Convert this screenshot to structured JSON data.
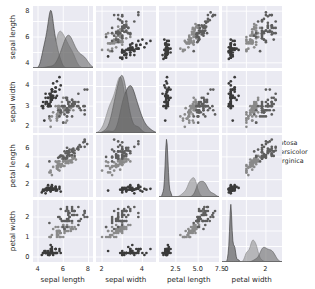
{
  "figure": {
    "type": "pairplot-scatter-matrix",
    "background": "#ffffff",
    "panel_background": "#eaeaf2",
    "gridline_color": "#ffffff",
    "width": 315,
    "height": 289
  },
  "legend": {
    "position": "center-right",
    "entries": [
      {
        "label": "setosa",
        "color": "#3b3b3b"
      },
      {
        "label": "versicolor",
        "color": "#8a8a8a"
      },
      {
        "label": "virginica",
        "color": "#5e5e5e"
      }
    ]
  },
  "chart_data": {
    "type": "scatter",
    "title": "",
    "variables": [
      "sepal length",
      "sepal width",
      "petal length",
      "petal width"
    ],
    "groups": [
      "setosa",
      "versicolor",
      "virginica"
    ],
    "group_colors": [
      "#3b3b3b",
      "#8a8a8a",
      "#5e5e5e"
    ],
    "legend_position": "center-right",
    "grid": true,
    "diagonal": "kde",
    "axes": {
      "sepal length": {
        "label": "sepal length",
        "lim": [
          3.6,
          8.4
        ],
        "ticks": [
          4,
          6,
          8
        ],
        "ticklabels": [
          "4",
          "6",
          "8"
        ]
      },
      "sepal width": {
        "label": "sepal width",
        "lim": [
          1.7,
          4.7
        ],
        "ticks": [
          2,
          3,
          4
        ],
        "ticklabels": [
          "2",
          "3",
          "4"
        ]
      },
      "petal length": {
        "label": "petal length",
        "lim": [
          0.6,
          7.4
        ],
        "ticks": [
          2.5,
          5.0,
          7.5
        ],
        "ticklabels": [
          "2.5",
          "5.0",
          "7.5"
        ]
      },
      "petal width": {
        "label": "petal width",
        "lim": [
          -0.25,
          2.85
        ],
        "ticks": [
          0,
          1,
          2
        ],
        "ticklabels": [
          "0",
          "1",
          "2"
        ]
      }
    },
    "x_tick_rows": {
      "sepal length": [
        "4",
        "6",
        "8"
      ],
      "sepal width": [
        "2",
        "4"
      ],
      "petal length": [
        "2.5",
        "5.0",
        "7.5"
      ],
      "petal width": [
        "0",
        "2"
      ]
    },
    "y_tick_cols": {
      "sepal length": [
        "4",
        "6",
        "8"
      ],
      "sepal width": [
        "2",
        "3",
        "4"
      ],
      "petal length": [
        "2",
        "4",
        "6"
      ],
      "petal width": [
        "0",
        "1",
        "2"
      ]
    },
    "data": {
      "setosa": {
        "sepal length": [
          5.1,
          4.9,
          4.7,
          4.6,
          5.0,
          5.4,
          4.6,
          5.0,
          4.4,
          4.9,
          5.4,
          4.8,
          4.8,
          4.3,
          5.8,
          5.7,
          5.4,
          5.1,
          5.7,
          5.1,
          5.4,
          5.1,
          4.6,
          5.1,
          4.8,
          5.0,
          5.0,
          5.2,
          5.2,
          4.7,
          4.8,
          5.4,
          5.2,
          5.5,
          4.9,
          5.0,
          5.5,
          4.9,
          4.4,
          5.1,
          5.0,
          4.5,
          4.4,
          5.0,
          5.1,
          4.8,
          5.1,
          4.6,
          5.3,
          5.0
        ],
        "sepal width": [
          3.5,
          3.0,
          3.2,
          3.1,
          3.6,
          3.9,
          3.4,
          3.4,
          2.9,
          3.1,
          3.7,
          3.4,
          3.0,
          3.0,
          4.0,
          4.4,
          3.9,
          3.5,
          3.8,
          3.8,
          3.4,
          3.7,
          3.6,
          3.3,
          3.4,
          3.0,
          3.4,
          3.5,
          3.4,
          3.2,
          3.1,
          3.4,
          4.1,
          4.2,
          3.1,
          3.2,
          3.5,
          3.6,
          3.0,
          3.4,
          3.5,
          2.3,
          3.2,
          3.5,
          3.8,
          3.0,
          3.8,
          3.2,
          3.7,
          3.3
        ],
        "petal length": [
          1.4,
          1.4,
          1.3,
          1.5,
          1.4,
          1.7,
          1.4,
          1.5,
          1.4,
          1.5,
          1.5,
          1.6,
          1.4,
          1.1,
          1.2,
          1.5,
          1.3,
          1.4,
          1.7,
          1.5,
          1.7,
          1.5,
          1.0,
          1.7,
          1.9,
          1.6,
          1.6,
          1.5,
          1.4,
          1.6,
          1.6,
          1.5,
          1.5,
          1.4,
          1.5,
          1.2,
          1.3,
          1.4,
          1.3,
          1.5,
          1.3,
          1.3,
          1.3,
          1.6,
          1.9,
          1.4,
          1.6,
          1.4,
          1.5,
          1.4
        ],
        "petal width": [
          0.2,
          0.2,
          0.2,
          0.2,
          0.2,
          0.4,
          0.3,
          0.2,
          0.2,
          0.1,
          0.2,
          0.2,
          0.1,
          0.1,
          0.2,
          0.4,
          0.4,
          0.3,
          0.3,
          0.3,
          0.2,
          0.4,
          0.2,
          0.5,
          0.2,
          0.2,
          0.4,
          0.2,
          0.2,
          0.2,
          0.2,
          0.4,
          0.1,
          0.2,
          0.2,
          0.2,
          0.2,
          0.1,
          0.2,
          0.2,
          0.3,
          0.3,
          0.2,
          0.6,
          0.4,
          0.3,
          0.2,
          0.2,
          0.2,
          0.2
        ]
      },
      "versicolor": {
        "sepal length": [
          7.0,
          6.4,
          6.9,
          5.5,
          6.5,
          5.7,
          6.3,
          4.9,
          6.6,
          5.2,
          5.0,
          5.9,
          6.0,
          6.1,
          5.6,
          6.7,
          5.6,
          5.8,
          6.2,
          5.6,
          5.9,
          6.1,
          6.3,
          6.1,
          6.4,
          6.6,
          6.8,
          6.7,
          6.0,
          5.7,
          5.5,
          5.5,
          5.8,
          6.0,
          5.4,
          6.0,
          6.7,
          6.3,
          5.6,
          5.5,
          5.5,
          6.1,
          5.8,
          5.0,
          5.6,
          5.7,
          5.7,
          6.2,
          5.1,
          5.7
        ],
        "sepal width": [
          3.2,
          3.2,
          3.1,
          2.3,
          2.8,
          2.8,
          3.3,
          2.4,
          2.9,
          2.7,
          2.0,
          3.0,
          2.2,
          2.9,
          2.9,
          3.1,
          3.0,
          2.7,
          2.2,
          2.5,
          3.2,
          2.8,
          2.5,
          2.8,
          2.9,
          3.0,
          2.8,
          3.0,
          2.9,
          2.6,
          2.4,
          2.4,
          2.7,
          2.7,
          3.0,
          3.4,
          3.1,
          2.3,
          3.0,
          2.5,
          2.6,
          3.0,
          2.6,
          2.3,
          2.7,
          3.0,
          2.9,
          2.9,
          2.5,
          2.8
        ],
        "petal length": [
          4.7,
          4.5,
          4.9,
          4.0,
          4.6,
          4.5,
          4.7,
          3.3,
          4.6,
          3.9,
          3.5,
          4.2,
          4.0,
          4.7,
          3.6,
          4.4,
          4.5,
          4.1,
          4.5,
          3.9,
          4.8,
          4.0,
          4.9,
          4.7,
          4.3,
          4.4,
          4.8,
          5.0,
          4.5,
          3.5,
          3.8,
          3.7,
          3.9,
          5.1,
          4.5,
          4.5,
          4.7,
          4.4,
          4.1,
          4.0,
          4.4,
          4.6,
          4.0,
          3.3,
          4.2,
          4.2,
          4.2,
          4.3,
          3.0,
          4.1
        ],
        "petal width": [
          1.4,
          1.5,
          1.5,
          1.3,
          1.5,
          1.3,
          1.6,
          1.0,
          1.3,
          1.4,
          1.0,
          1.5,
          1.0,
          1.4,
          1.3,
          1.4,
          1.5,
          1.0,
          1.5,
          1.1,
          1.8,
          1.3,
          1.5,
          1.2,
          1.3,
          1.4,
          1.4,
          1.7,
          1.5,
          1.0,
          1.1,
          1.0,
          1.2,
          1.6,
          1.5,
          1.6,
          1.5,
          1.3,
          1.3,
          1.3,
          1.2,
          1.4,
          1.2,
          1.0,
          1.3,
          1.2,
          1.3,
          1.3,
          1.1,
          1.3
        ]
      },
      "virginica": {
        "sepal length": [
          6.3,
          5.8,
          7.1,
          6.3,
          6.5,
          7.6,
          4.9,
          7.3,
          6.7,
          7.2,
          6.5,
          6.4,
          6.8,
          5.7,
          5.8,
          6.4,
          6.5,
          7.7,
          7.7,
          6.0,
          6.9,
          5.6,
          7.7,
          6.3,
          6.7,
          7.2,
          6.2,
          6.1,
          6.4,
          7.2,
          7.4,
          7.9,
          6.4,
          6.3,
          6.1,
          7.7,
          6.3,
          6.4,
          6.0,
          6.9,
          6.7,
          6.9,
          5.8,
          6.8,
          6.7,
          6.7,
          6.3,
          6.5,
          6.2,
          5.9
        ],
        "sepal width": [
          3.3,
          2.7,
          3.0,
          2.9,
          3.0,
          3.0,
          2.5,
          2.9,
          2.5,
          3.6,
          3.2,
          2.7,
          3.0,
          2.5,
          2.8,
          3.2,
          3.0,
          3.8,
          2.6,
          2.2,
          3.2,
          2.8,
          2.8,
          2.7,
          3.3,
          3.2,
          2.8,
          3.0,
          2.8,
          3.0,
          2.8,
          3.8,
          2.8,
          2.8,
          2.6,
          3.0,
          3.4,
          3.1,
          3.0,
          3.1,
          3.1,
          3.1,
          2.7,
          3.2,
          3.3,
          3.0,
          2.5,
          3.0,
          3.4,
          3.0
        ],
        "petal length": [
          6.0,
          5.1,
          5.9,
          5.6,
          5.8,
          6.6,
          4.5,
          6.3,
          5.8,
          6.1,
          5.1,
          5.3,
          5.5,
          5.0,
          5.1,
          5.3,
          5.5,
          6.7,
          6.9,
          5.0,
          5.7,
          4.9,
          6.7,
          4.9,
          5.7,
          6.0,
          4.8,
          4.9,
          5.6,
          5.8,
          6.1,
          6.4,
          5.6,
          5.1,
          5.6,
          6.1,
          5.6,
          5.5,
          4.8,
          5.4,
          5.6,
          5.1,
          5.1,
          5.9,
          5.7,
          5.2,
          5.0,
          5.2,
          5.4,
          5.1
        ],
        "petal width": [
          2.5,
          1.9,
          2.1,
          1.8,
          2.2,
          2.1,
          1.7,
          1.8,
          1.8,
          2.5,
          2.0,
          1.9,
          2.1,
          2.0,
          2.4,
          2.3,
          1.8,
          2.2,
          2.3,
          1.5,
          2.3,
          2.0,
          2.0,
          1.8,
          2.1,
          1.8,
          1.8,
          1.8,
          2.1,
          1.6,
          1.9,
          2.0,
          2.2,
          1.5,
          1.4,
          2.3,
          2.4,
          1.8,
          1.8,
          2.1,
          2.4,
          2.3,
          1.9,
          2.3,
          2.5,
          2.3,
          1.9,
          2.0,
          2.3,
          1.8
        ]
      }
    }
  }
}
